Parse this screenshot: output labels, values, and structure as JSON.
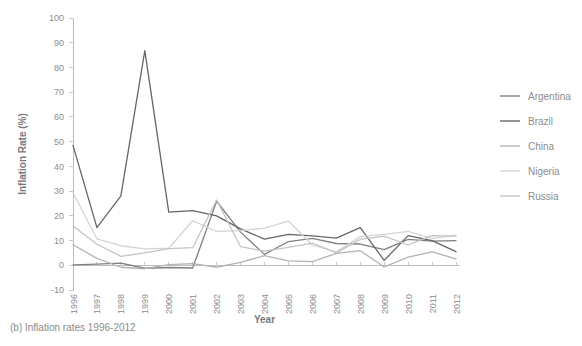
{
  "figure": {
    "caption": "(b) Inflation rates 1996-2012",
    "background_color": "#ffffff"
  },
  "chart_data": {
    "type": "line",
    "title": "",
    "xlabel": "Year",
    "ylabel": "Inflation Rate (%)",
    "x": [
      1996,
      1997,
      1998,
      1999,
      2000,
      2001,
      2002,
      2003,
      2004,
      2005,
      2006,
      2007,
      2008,
      2009,
      2010,
      2011,
      2012
    ],
    "xtick_labels": [
      "1996",
      "1997",
      "1998",
      "1999",
      "2000",
      "2001",
      "2002",
      "2003",
      "2004",
      "2005",
      "2006",
      "2007",
      "2008",
      "2009",
      "2010",
      "2011",
      "2012"
    ],
    "ytick_labels": [
      "-10",
      "0",
      "10",
      "20",
      "30",
      "40",
      "50",
      "60",
      "70",
      "80",
      "90",
      "100"
    ],
    "ylim": [
      -10,
      100
    ],
    "xlim": [
      1996,
      2012
    ],
    "ytick_step": 10,
    "grid": false,
    "legend_position": "right",
    "series": [
      {
        "name": "Argentina",
        "color": "#808080",
        "values": [
          0.2,
          0.5,
          0.9,
          -1.2,
          -0.9,
          -1.1,
          25.9,
          13.4,
          4.4,
          9.6,
          10.9,
          8.8,
          8.6,
          6.3,
          10.5,
          9.8,
          10.0
        ]
      },
      {
        "name": "Brazil",
        "color": "#666666",
        "values": [
          48.5,
          15.2,
          28.1,
          86.8,
          21.5,
          22.1,
          20.0,
          14.7,
          10.6,
          12.5,
          11.9,
          11.0,
          15.2,
          2.0,
          12.0,
          10.0,
          5.5
        ]
      },
      {
        "name": "China",
        "color": "#b3b3b3",
        "values": [
          8.3,
          2.8,
          -0.8,
          -1.4,
          0.3,
          0.7,
          -0.8,
          1.2,
          3.9,
          1.8,
          1.5,
          4.8,
          5.9,
          -0.7,
          3.3,
          5.4,
          2.6
        ]
      },
      {
        "name": "Nigeria",
        "color": "#d4d4d4",
        "values": [
          29.3,
          10.7,
          7.9,
          6.6,
          6.9,
          18.0,
          13.7,
          14.0,
          15.0,
          17.9,
          8.2,
          5.4,
          11.6,
          12.5,
          13.7,
          10.8,
          12.2
        ]
      },
      {
        "name": "Russia",
        "color": "#c4c4c4",
        "values": [
          15.9,
          8.5,
          3.6,
          5.0,
          6.7,
          7.1,
          26.4,
          7.5,
          5.7,
          7.2,
          9.0,
          5.0,
          10.5,
          11.8,
          8.2,
          12.0,
          11.8
        ]
      }
    ]
  },
  "legend": {
    "items": [
      {
        "label": "Argentina",
        "color": "#808080"
      },
      {
        "label": "Brazil",
        "color": "#666666"
      },
      {
        "label": "China",
        "color": "#b3b3b3"
      },
      {
        "label": "Nigeria",
        "color": "#d4d4d4"
      },
      {
        "label": "Russia",
        "color": "#c4c4c4"
      }
    ]
  }
}
